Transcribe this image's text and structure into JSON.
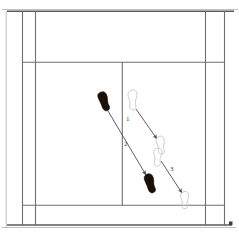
{
  "diagram": {
    "title": "Badminton court footwork diagram",
    "background_color": "#ffffff"
  },
  "colors": {
    "court_line": "#6f6f6f",
    "court_line_outer": "#5a5a5a",
    "court_line_faint": "#b9b9b9",
    "footprint_filled": "#1a1008",
    "footprint_outline_stroke": "#c9c9c9",
    "arrow": "#4d4d4d",
    "label_text": "#3a3a3a"
  },
  "court": {
    "name": "badminton-court",
    "orientation": "half-court-top-view",
    "lines": [
      {
        "name": "top-boundary-line",
        "type": "horizontal",
        "x1": 7,
        "y1": 11,
        "x2": 232,
        "y2": 11,
        "weight": "outer"
      },
      {
        "name": "bottom-boundary-line",
        "type": "horizontal",
        "x1": 7,
        "y1": 225,
        "x2": 232,
        "y2": 225,
        "weight": "outer"
      },
      {
        "name": "left-doubles-sideline",
        "type": "vertical",
        "x1": 22,
        "y1": 11,
        "x2": 22,
        "y2": 225,
        "weight": "normal"
      },
      {
        "name": "left-singles-sideline",
        "type": "vertical",
        "x1": 35,
        "y1": 11,
        "x2": 35,
        "y2": 225,
        "weight": "normal"
      },
      {
        "name": "right-singles-sideline",
        "type": "vertical",
        "x1": 205,
        "y1": 11,
        "x2": 205,
        "y2": 225,
        "weight": "normal"
      },
      {
        "name": "right-doubles-sideline",
        "type": "vertical",
        "x1": 224,
        "y1": 11,
        "x2": 224,
        "y2": 225,
        "weight": "normal"
      },
      {
        "name": "top-service-line",
        "type": "horizontal",
        "x1": 22,
        "y1": 62,
        "x2": 224,
        "y2": 62,
        "weight": "normal"
      },
      {
        "name": "bottom-service-line",
        "type": "horizontal",
        "x1": 22,
        "y1": 205,
        "x2": 224,
        "y2": 205,
        "weight": "normal"
      },
      {
        "name": "centre-line",
        "type": "vertical",
        "x1": 122,
        "y1": 62,
        "x2": 122,
        "y2": 205,
        "weight": "normal"
      }
    ]
  },
  "footprints": [
    {
      "name": "footprint-start-left-filled",
      "style": "filled",
      "label": "start position left foot",
      "x": 105,
      "y": 101,
      "rotation": -22
    },
    {
      "name": "footprint-start-right-outline",
      "style": "outline",
      "label": "start position right foot",
      "x": 133,
      "y": 100,
      "rotation": -8
    },
    {
      "name": "footprint-mid-right-outline-a",
      "style": "outline",
      "label": "step 1 landing right foot",
      "x": 160,
      "y": 145,
      "rotation": -14
    },
    {
      "name": "footprint-mid-right-outline-b",
      "style": "outline",
      "label": "step 3 push-off right foot",
      "x": 158,
      "y": 156,
      "rotation": -4
    },
    {
      "name": "footprint-end-left-filled",
      "style": "filled",
      "label": "step 2 landing left foot",
      "x": 151,
      "y": 183,
      "rotation": -20
    },
    {
      "name": "footprint-end-right-outline",
      "style": "outline",
      "label": "step 3 landing right foot",
      "x": 185,
      "y": 200,
      "rotation": -6
    }
  ],
  "movements": [
    {
      "name": "movement-arrow-1",
      "step": "1",
      "from": "footprint-start-right-outline",
      "to": "footprint-mid-right-outline-a",
      "x1": 136,
      "y1": 109,
      "x2": 158,
      "y2": 141,
      "label_x": 127,
      "label_y": 119
    },
    {
      "name": "movement-arrow-2",
      "step": "2",
      "from": "footprint-start-left-filled",
      "to": "footprint-end-left-filled",
      "x1": 108,
      "y1": 111,
      "x2": 147,
      "y2": 177,
      "label_x": 125,
      "label_y": 144
    },
    {
      "name": "movement-arrow-3",
      "step": "3",
      "from": "footprint-mid-right-outline-b",
      "to": "footprint-end-right-outline",
      "x1": 161,
      "y1": 161,
      "x2": 183,
      "y2": 195,
      "label_x": 171,
      "label_y": 169
    }
  ],
  "step_labels": [
    {
      "name": "step-label-1",
      "text": "1"
    },
    {
      "name": "step-label-2",
      "text": "2"
    },
    {
      "name": "step-label-3",
      "text": "3"
    }
  ]
}
